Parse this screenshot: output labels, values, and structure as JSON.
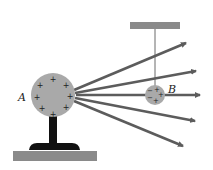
{
  "diagram": {
    "title": "",
    "labels": {
      "sphere_a": "A",
      "sphere_b": "B"
    },
    "sphere_a": {
      "charge": "+",
      "charge_count": 8,
      "color": "#a9a9a9"
    },
    "sphere_b": {
      "charges": [
        "-",
        "+",
        "-",
        "+",
        "+"
      ],
      "color": "#a9a9a9"
    },
    "field_lines": 5,
    "colors": {
      "arrow": "#5c5c5c",
      "stand": "#111111",
      "platform": "#8a8a8a",
      "support_bar": "#8a8a8a",
      "thread": "#444444"
    }
  }
}
